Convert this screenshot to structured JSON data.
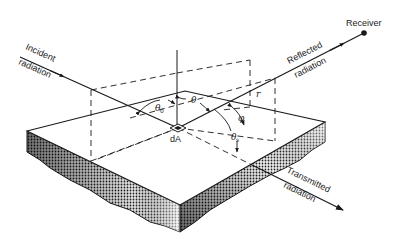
{
  "diagram": {
    "labels": {
      "incident": [
        "Incident",
        "radiation"
      ],
      "reflected": [
        "Reflected",
        "radiation"
      ],
      "transmitted": [
        "Transmitted",
        "radiation"
      ],
      "receiver": "Receiver",
      "area_element": "dA",
      "theta0": "θ",
      "theta0_sub": "0",
      "theta": "θ",
      "phi": "φ",
      "theta_s": "θ",
      "theta_s_sub": "s",
      "r": "r"
    },
    "elements": [
      "incident-ray",
      "reflected-ray",
      "transmitted-ray",
      "surface-normal",
      "slab",
      "incidence-plane",
      "reflection-plane",
      "receiver-point"
    ],
    "colors": {
      "line": "#1a1a1a",
      "background": "#ffffff",
      "shade_dark": "#2a2a2a",
      "shade_light": "#d8d8d8"
    }
  }
}
